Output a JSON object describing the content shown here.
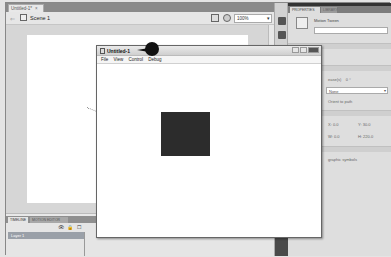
{
  "document_tab": {
    "label": "Untitled-1*",
    "close": "×"
  },
  "scene_bar": {
    "scene_label": "Scene 1",
    "zoom_value": "100%"
  },
  "timeline": {
    "tabs": [
      {
        "label": "TIMELINE"
      },
      {
        "label": "MOTION EDITOR"
      }
    ],
    "layer_name": "Layer 1"
  },
  "properties": {
    "tabs": [
      {
        "label": "PROPERTIES"
      },
      {
        "label": "LIBRARY"
      }
    ],
    "instance_type": "Motion Tween",
    "ease_label": "ease(s)",
    "ease_value": "0 °",
    "rotate_select": "None",
    "orient_label": "Orient to path",
    "x_label": "X: 0.0",
    "y_label": "Y: 30.0",
    "w_label": "W: 0.0",
    "h_label": "H: 220.0",
    "sync_label": "graphic symbols"
  },
  "swf_window": {
    "title": "Untitled-1",
    "menu": [
      "File",
      "View",
      "Control",
      "Debug"
    ]
  },
  "colors": {
    "square": "#2c2c2c",
    "callout": "#111111",
    "panel_dark": "#333333"
  }
}
